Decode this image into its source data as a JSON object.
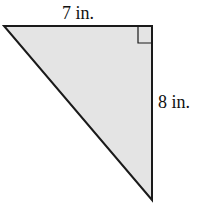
{
  "diagram": {
    "shape": "right triangle",
    "fill_color": "#e4e4e4",
    "stroke_color": "#1a1a1a",
    "labels": {
      "top_side": "7 in.",
      "right_side": "8 in."
    },
    "right_angle_marker": true
  }
}
